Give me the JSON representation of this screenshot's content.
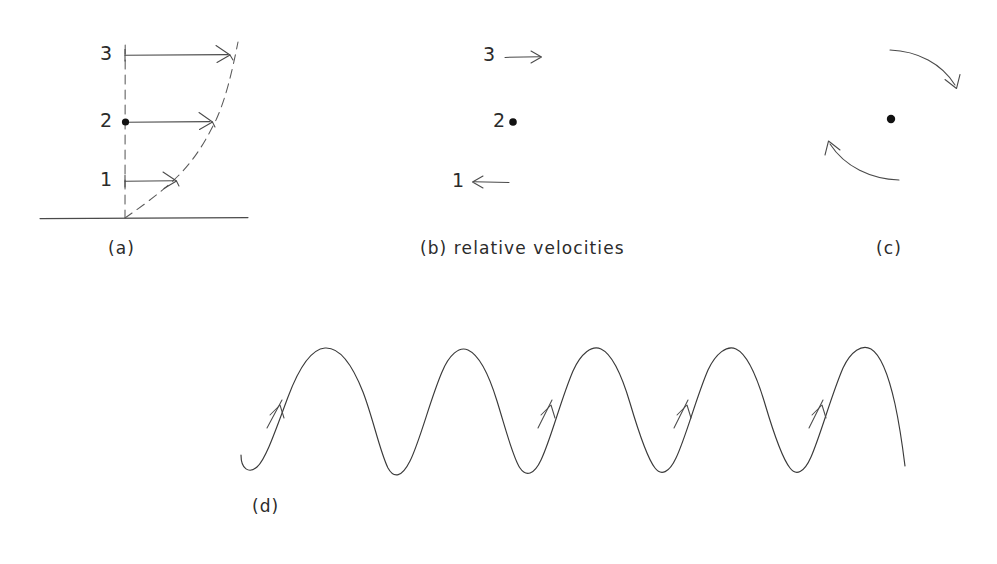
{
  "figure": {
    "background_color": "#ffffff",
    "ink_color": "#3a3a3a"
  },
  "panels": [
    {
      "id": "a",
      "caption": "(a)",
      "caption_x": 108,
      "caption_y": 240,
      "description": "velocity profile with dashed shear curve",
      "axis": {
        "vertical_x": 125,
        "vertical_top": 45,
        "vertical_bottom": 218,
        "baseline_y": 218,
        "baseline_x1": 40,
        "baseline_x2": 248
      },
      "levels": [
        {
          "label": "3",
          "label_x": 100,
          "label_y": 46,
          "y": 55,
          "arrow_x1": 125,
          "arrow_x2": 230,
          "marker": "tick"
        },
        {
          "label": "2",
          "label_x": 100,
          "label_y": 113,
          "y": 122,
          "arrow_x1": 125,
          "arrow_x2": 212,
          "marker": "dot"
        },
        {
          "label": "1",
          "label_x": 100,
          "label_y": 172,
          "y": 181,
          "arrow_x1": 125,
          "arrow_x2": 176,
          "marker": "tick"
        }
      ]
    },
    {
      "id": "b",
      "caption": "(b) relative velocities",
      "caption_x": 420,
      "caption_y": 240,
      "description": "relative velocity arrows about level 2",
      "items": [
        {
          "label": "3",
          "label_x": 483,
          "label_y": 47,
          "arrow_dir": "right",
          "y": 57,
          "arrow_x1": 505,
          "arrow_x2": 541
        },
        {
          "label": "2",
          "label_x": 493,
          "label_y": 113,
          "arrow_dir": "none",
          "y": 122,
          "dot_x": 513
        },
        {
          "label": "1",
          "label_x": 452,
          "label_y": 173,
          "arrow_dir": "left",
          "y": 182,
          "arrow_x1": 509,
          "arrow_x2": 472
        }
      ]
    },
    {
      "id": "c",
      "caption": "(c)",
      "caption_x": 876,
      "caption_y": 240,
      "description": "rotation couple: two curved arrows about a centre dot",
      "centre": {
        "x": 891,
        "y": 119
      },
      "arcs": [
        {
          "name": "upper-clockwise-arc",
          "from_x": 890,
          "from_y": 50,
          "to_x": 957,
          "to_y": 86,
          "direction": "clockwise"
        },
        {
          "name": "lower-counterclockwise-arc",
          "from_x": 898,
          "from_y": 180,
          "to_x": 828,
          "to_y": 142,
          "direction": "counterclockwise"
        }
      ]
    },
    {
      "id": "d",
      "caption": "(d)",
      "caption_x": 252,
      "caption_y": 498,
      "description": "trochoidal wave profile with rounded crests, sharp troughs and upward particle-motion arrows",
      "wave": {
        "start_x": 240,
        "start_y": 466,
        "end_x": 905,
        "end_y": 466,
        "crest_y": 348,
        "trough_y": 470,
        "crest_x": [
          325,
          452,
          592,
          728,
          862
        ],
        "trough_x": [
          388,
          520,
          655,
          790
        ],
        "arrow_x": [
          276,
          547,
          683,
          818
        ],
        "arrow_y": [
          415,
          415,
          415,
          415
        ]
      }
    }
  ]
}
